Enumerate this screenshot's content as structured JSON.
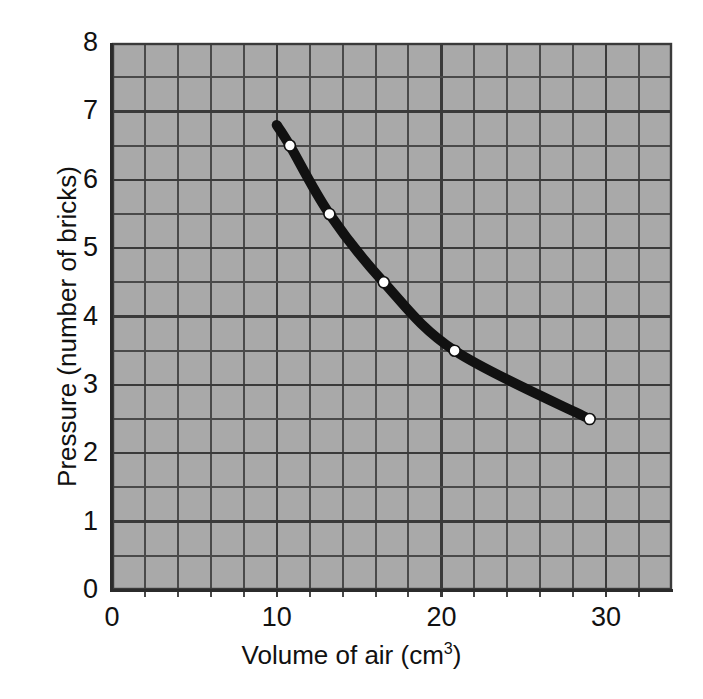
{
  "chart_data": {
    "type": "line",
    "title": "",
    "xlabel": "Volume of air (cm³)",
    "xlabel_main": "Volume of air (cm",
    "xlabel_sup": "3",
    "xlabel_tail": ")",
    "ylabel": "Pressure (number of bricks)",
    "xlim": [
      0,
      34
    ],
    "ylim": [
      0,
      8
    ],
    "xticks": [
      0,
      10,
      20,
      30
    ],
    "xtick_labels": [
      "0",
      "10",
      "20",
      "30"
    ],
    "yticks": [
      0,
      1,
      2,
      3,
      4,
      5,
      6,
      7,
      8
    ],
    "ytick_labels": [
      "0",
      "1",
      "2",
      "3",
      "4",
      "5",
      "6",
      "7",
      "8"
    ],
    "x_minor_step": 2,
    "y_minor_step": 0.5,
    "grid": true,
    "grid_major_color": "#3a3a3a",
    "grid_minor_color": "#4a4a4a",
    "plot_background_color": "#a9a9a9",
    "page_background_color": "#ffffff",
    "line_color": "#111111",
    "line_width": 10,
    "marker_face_color": "#ffffff",
    "marker_edge_color": "#111111",
    "marker_size": 11,
    "legend": null,
    "legend_position": "none",
    "series": [
      {
        "name": "Pressure vs volume",
        "x": [
          10.8,
          13.2,
          16.5,
          20.8,
          29.0
        ],
        "y": [
          6.5,
          5.5,
          4.5,
          3.5,
          2.5
        ]
      }
    ],
    "line_start_point": {
      "x": 10.0,
      "y": 6.8
    },
    "annotations": []
  },
  "axes": {
    "x_title": "Volume of air (cm³)",
    "y_title": "Pressure (number of bricks)"
  }
}
